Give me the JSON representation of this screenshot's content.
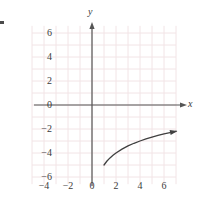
{
  "figure": {
    "background_color": "#ffffff",
    "grid_color": "#f2e4e6",
    "axis_color": "#555555",
    "curve_color": "#404040",
    "label_color": "#3b3b3b",
    "corner_mark": "corner-tick-mark"
  },
  "axes": {
    "x_axis_name": "x",
    "y_axis_name": "y",
    "origin_label": "0"
  },
  "chart_data": {
    "type": "line",
    "title": "",
    "xlabel": "x",
    "ylabel": "y",
    "xlim": [
      -5.0,
      7.8
    ],
    "ylim": [
      -7.0,
      7.0
    ],
    "grid": true,
    "grid_step": 1,
    "legend": "none",
    "xticks": [
      -4,
      -2,
      0,
      2,
      4,
      6
    ],
    "xtick_labels": [
      "−4",
      "−2",
      "0",
      "2",
      "4",
      "6"
    ],
    "yticks": [
      6,
      4,
      2,
      0,
      -2,
      -4,
      -6
    ],
    "ytick_labels": [
      "6",
      "4",
      "2",
      "0",
      "−2",
      "−4",
      "−6"
    ],
    "series": [
      {
        "name": "curve",
        "arrow_end": true,
        "x": [
          1.0,
          1.25,
          1.5,
          1.75,
          2.0,
          2.5,
          3.0,
          3.5,
          4.0,
          4.5,
          5.0,
          5.5,
          6.0,
          6.5,
          7.0
        ],
        "y": [
          -5.0,
          -4.67,
          -4.41,
          -4.19,
          -4.0,
          -3.68,
          -3.41,
          -3.19,
          -3.0,
          -2.83,
          -2.68,
          -2.54,
          -2.41,
          -2.3,
          -2.19
        ]
      }
    ],
    "annotations": []
  },
  "ytick_positions": [
    {
      "label": "6",
      "value": 6
    },
    {
      "label": "4",
      "value": 4
    },
    {
      "label": "2",
      "value": 2
    },
    {
      "label": "0",
      "value": 0
    },
    {
      "label": "−2",
      "value": -2
    },
    {
      "label": "−4",
      "value": -4
    },
    {
      "label": "−6",
      "value": -6
    }
  ],
  "xtick_positions": [
    {
      "label": "−4",
      "value": -4
    },
    {
      "label": "−2",
      "value": -2
    },
    {
      "label": "0",
      "value": 0
    },
    {
      "label": "2",
      "value": 2
    },
    {
      "label": "4",
      "value": 4
    },
    {
      "label": "6",
      "value": 6
    }
  ]
}
